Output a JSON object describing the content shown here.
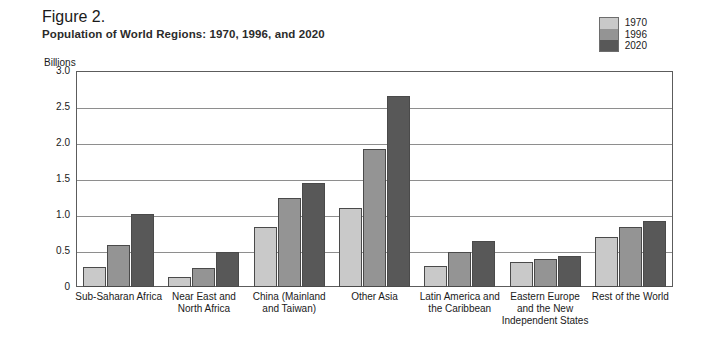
{
  "header": {
    "figure_number": "Figure 2.",
    "title": "Population of World Regions:  1970, 1996, and 2020"
  },
  "legend": {
    "items": [
      {
        "label": "1970",
        "color": "#c9c9c9"
      },
      {
        "label": "1996",
        "color": "#949494"
      },
      {
        "label": "2020",
        "color": "#585858"
      }
    ]
  },
  "chart_data": {
    "type": "bar",
    "title": "Population of World Regions:  1970, 1996, and 2020",
    "xlabel": "",
    "ylabel": "Billions",
    "ylim": [
      0,
      3.0
    ],
    "yticks": [
      "0",
      "0.5",
      "1.0",
      "1.5",
      "2.0",
      "2.5",
      "3.0"
    ],
    "ytick_values": [
      0,
      0.5,
      1.0,
      1.5,
      2.0,
      2.5,
      3.0
    ],
    "grid": true,
    "legend_position": "top-right",
    "categories": [
      "Sub-Saharan Africa",
      "Near East and\nNorth Africa",
      "China (Mainland\nand Taiwan)",
      "Other Asia",
      "Latin America and\nthe Caribbean",
      "Eastern Europe\nand the New\nIndependent States",
      "Rest of the World"
    ],
    "series": [
      {
        "name": "1970",
        "color": "#c9c9c9",
        "values": [
          0.28,
          0.14,
          0.83,
          1.1,
          0.29,
          0.35,
          0.7
        ]
      },
      {
        "name": "1996",
        "color": "#949494",
        "values": [
          0.58,
          0.27,
          1.23,
          1.92,
          0.49,
          0.39,
          0.84
        ]
      },
      {
        "name": "2020",
        "color": "#585858",
        "values": [
          1.02,
          0.48,
          1.45,
          2.65,
          0.64,
          0.43,
          0.92
        ]
      }
    ]
  }
}
